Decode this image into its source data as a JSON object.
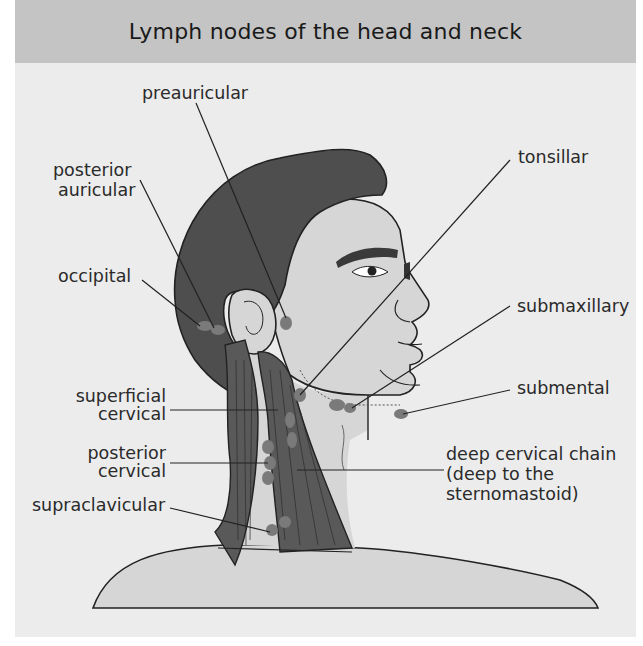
{
  "header": {
    "title": "Lymph nodes of the head and neck"
  },
  "colors": {
    "panel_bg": "#ececec",
    "header_bg": "#c4c4c4",
    "hair": "#4e4e4e",
    "skin": "#d6d6d6",
    "muscle": "#595959",
    "node": "#7a7a7a",
    "line": "#222222"
  },
  "labels": {
    "preauricular": "preauricular",
    "posterior_auricular_1": "posterior",
    "posterior_auricular_2": "auricular",
    "occipital": "occipital",
    "superficial_cervical_1": "superficial",
    "superficial_cervical_2": "cervical",
    "posterior_cervical_1": "posterior",
    "posterior_cervical_2": "cervical",
    "supraclavicular": "supraclavicular",
    "tonsillar": "tonsillar",
    "submaxillary": "submaxillary",
    "submental": "submental",
    "deep_cervical_1": "deep cervical chain",
    "deep_cervical_2": "(deep to the",
    "deep_cervical_3": "sternomastoid)"
  }
}
